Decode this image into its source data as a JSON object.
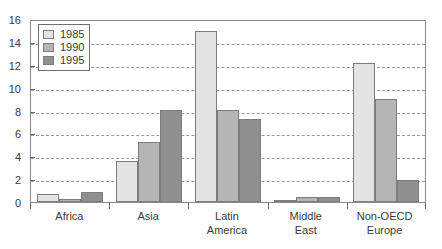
{
  "chart_data": {
    "type": "bar",
    "title": "",
    "subtitle": "",
    "xlabel": "",
    "ylabel": "",
    "categories": [
      "Africa",
      "Asia",
      "Latin America",
      "Middle East",
      "Non-OECD Europe"
    ],
    "category_lines": [
      [
        "Africa"
      ],
      [
        "Asia"
      ],
      [
        "Latin",
        "America"
      ],
      [
        "Middle",
        "East"
      ],
      [
        "Non-OECD",
        "Europe"
      ]
    ],
    "series": [
      {
        "name": "1985",
        "color": "#e3e3e3",
        "values": [
          0.7,
          3.6,
          15.0,
          0.2,
          12.2
        ]
      },
      {
        "name": "1990",
        "color": "#b5b5b5",
        "values": [
          0.25,
          5.3,
          8.1,
          0.4,
          9.1
        ]
      },
      {
        "name": "1995",
        "color": "#8f8f8f",
        "values": [
          0.9,
          8.1,
          7.3,
          0.4,
          1.9
        ]
      }
    ],
    "ylim": [
      0,
      16
    ],
    "yticks": [
      0,
      2,
      4,
      6,
      8,
      10,
      12,
      14,
      16
    ],
    "ytick_labels": [
      "0",
      "2",
      "4",
      "6",
      "8",
      "10",
      "12",
      "14",
      "16"
    ],
    "grid": true,
    "grid_axis": "y",
    "grid_style": "dashed",
    "legend_position": "top-left",
    "legend_entries": [
      "1985",
      "1990",
      "1995"
    ],
    "bar_border_color": "#7d7d7d",
    "axis_color": "#8a8a8a",
    "grid_color": "#9a9a9a",
    "text_color": "#3a3a3a"
  }
}
